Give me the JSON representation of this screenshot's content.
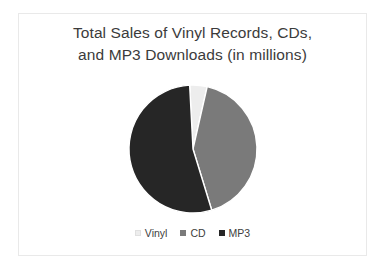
{
  "chart_data": {
    "type": "pie",
    "title": "Total Sales of Vinyl Records, CDs, and MP3 Downloads (in millions)",
    "title_line1": "Total Sales of Vinyl Records, CDs,",
    "title_line2": "and MP3 Downloads (in millions)",
    "categories": [
      "Vinyl",
      "CD",
      "MP3"
    ],
    "values": [
      4.4,
      41.7,
      53.9
    ],
    "unit": "millions",
    "percentages": [
      4.4,
      41.7,
      53.9
    ],
    "start_angle_deg": 357,
    "direction": "clockwise",
    "colors": [
      "#ededed",
      "#7a7a7a",
      "#262626"
    ],
    "legend_position": "bottom",
    "grid": false,
    "xlabel": "",
    "ylabel": "",
    "slices": [
      {
        "label": "Vinyl",
        "value": 4.4,
        "color": "#ededed",
        "start_deg": 357,
        "end_deg": 373
      },
      {
        "label": "CD",
        "value": 41.7,
        "color": "#7a7a7a",
        "start_deg": 373,
        "end_deg": 523
      },
      {
        "label": "MP3",
        "value": 53.9,
        "color": "#262626",
        "start_deg": 523,
        "end_deg": 717
      }
    ]
  },
  "legend": {
    "items": [
      {
        "label": "Vinyl",
        "color": "#ededed"
      },
      {
        "label": "CD",
        "color": "#7a7a7a"
      },
      {
        "label": "MP3",
        "color": "#262626"
      }
    ]
  },
  "canvas": {
    "background": "#ffffff",
    "border_color": "#e9e9e9",
    "title_color": "#3b3b3b",
    "legend_text_color": "#404040"
  }
}
